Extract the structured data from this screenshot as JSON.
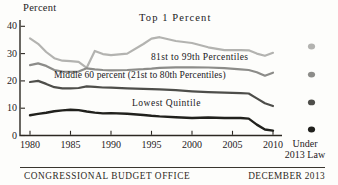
{
  "footer": {
    "left": "CONGRESSIONAL BUDGET OFFICE",
    "right": "DECEMBER 2013"
  },
  "colors": {
    "ink": "#2c2822",
    "background": "#fdfdfb"
  },
  "chart_data": {
    "type": "line",
    "title": "",
    "ylabel": "Percent",
    "xlabel": "",
    "ylim": [
      0,
      40
    ],
    "yticks": [
      0,
      10,
      20,
      30,
      40
    ],
    "xticks": [
      1980,
      1985,
      1990,
      1995,
      2000,
      2005,
      2010
    ],
    "x_extra_label": [
      "Under",
      "2013 Law"
    ],
    "x_extra_column": "Under 2013 Law",
    "grid": "off",
    "legend": "direct-labels-on-chart",
    "x": [
      1980,
      1981,
      1982,
      1983,
      1984,
      1985,
      1986,
      1987,
      1988,
      1989,
      1990,
      1992,
      1994,
      1995,
      1996,
      1998,
      2000,
      2002,
      2004,
      2006,
      2007,
      2008,
      2009,
      2010
    ],
    "series": [
      {
        "name": "Top 1 Percent",
        "color": "#b3b3b0",
        "values": [
          35.6,
          33.6,
          30.6,
          28.3,
          27.4,
          27.2,
          27.0,
          24.8,
          31.0,
          29.8,
          29.4,
          30.0,
          33.5,
          35.5,
          36.0,
          34.6,
          33.9,
          32.3,
          31.3,
          31.3,
          31.2,
          30.0,
          29.2,
          30.3
        ],
        "under_2013_law": 32.6
      },
      {
        "name": "81st to 99th Percentiles",
        "color": "#8c8c89",
        "values": [
          25.8,
          26.4,
          25.5,
          24.0,
          23.4,
          23.3,
          23.4,
          24.6,
          24.2,
          24.0,
          23.9,
          24.0,
          24.3,
          24.5,
          24.8,
          25.0,
          25.0,
          24.9,
          24.7,
          24.2,
          24.0,
          23.2,
          21.9,
          23.0
        ],
        "under_2013_law": 22.3
      },
      {
        "name": "Middle 60 percent (21st to 80th Percentiles)",
        "color": "#4e4e4a",
        "values": [
          19.6,
          20.0,
          18.9,
          17.7,
          17.3,
          17.3,
          17.4,
          18.0,
          17.8,
          17.6,
          17.5,
          17.3,
          17.1,
          17.0,
          16.9,
          16.6,
          16.2,
          15.9,
          15.7,
          15.5,
          15.4,
          13.6,
          11.8,
          10.8
        ],
        "under_2013_law": 12.1
      },
      {
        "name": "Lowest Quintile",
        "color": "#21211d",
        "values": [
          7.4,
          7.9,
          8.3,
          8.9,
          9.2,
          9.4,
          9.3,
          8.8,
          8.4,
          8.1,
          8.2,
          8.0,
          7.5,
          7.2,
          7.0,
          6.7,
          6.4,
          6.6,
          6.4,
          6.4,
          6.2,
          4.0,
          2.2,
          1.8
        ],
        "under_2013_law": 2.2
      }
    ]
  }
}
